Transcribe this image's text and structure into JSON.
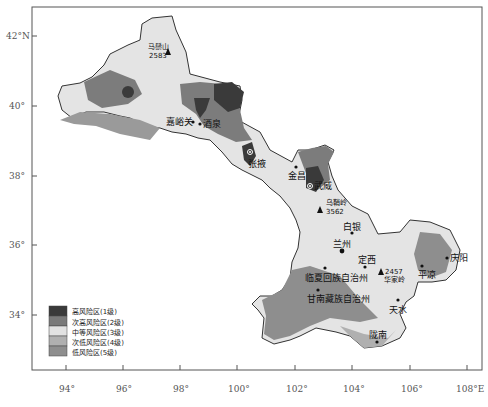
{
  "map": {
    "title": "",
    "axes": {
      "y_ticks": [
        {
          "label": "42°N",
          "y": 36
        },
        {
          "label": "40°",
          "y": 106
        },
        {
          "label": "38°",
          "y": 176
        },
        {
          "label": "36°",
          "y": 245
        },
        {
          "label": "34°",
          "y": 315
        }
      ],
      "x_ticks": [
        {
          "label": "94°",
          "x": 66
        },
        {
          "label": "96°",
          "x": 123
        },
        {
          "label": "98°",
          "x": 180
        },
        {
          "label": "100°",
          "x": 237
        },
        {
          "label": "102°",
          "x": 295
        },
        {
          "label": "104°",
          "x": 352
        },
        {
          "label": "106°",
          "x": 410
        },
        {
          "label": "108°E",
          "x": 467
        }
      ]
    },
    "legend": [
      {
        "label": "高风险区(1级)",
        "color": "#3a3a3a"
      },
      {
        "label": "次高风险区(2级)",
        "color": "#7a7a7a"
      },
      {
        "label": "中等风险区(3级)",
        "color": "#e2e2e2"
      },
      {
        "label": "次低风险区(4级)",
        "color": "#b0b0b0"
      },
      {
        "label": "低风险区(5级)",
        "color": "#8e8e8e"
      }
    ],
    "places": [
      {
        "name": "嘉峪关",
        "type": "city"
      },
      {
        "name": "酒泉",
        "type": "city"
      },
      {
        "name": "张掖",
        "type": "city"
      },
      {
        "name": "金昌",
        "type": "city"
      },
      {
        "name": "武威",
        "type": "city"
      },
      {
        "name": "白银",
        "type": "city"
      },
      {
        "name": "兰州",
        "type": "capital"
      },
      {
        "name": "定西",
        "type": "city"
      },
      {
        "name": "临夏回族自治州",
        "type": "city"
      },
      {
        "name": "甘南藏族自治州",
        "type": "city"
      },
      {
        "name": "天水",
        "type": "city"
      },
      {
        "name": "陇南",
        "type": "city"
      },
      {
        "name": "平凉",
        "type": "city"
      },
      {
        "name": "庆阳",
        "type": "city"
      }
    ],
    "peaks": [
      {
        "name": "马鬃山",
        "elevation": "2583"
      },
      {
        "name": "乌鞘岭",
        "elevation": "3562"
      },
      {
        "name": "华家岭",
        "elevation": "2457"
      }
    ]
  }
}
